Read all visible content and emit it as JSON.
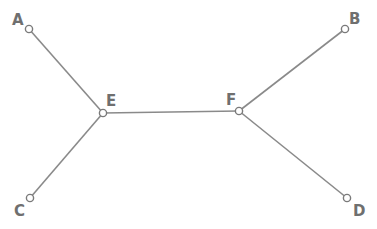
{
  "diagram": {
    "type": "tree",
    "colors": {
      "edge": "#8a8a8a",
      "node_stroke": "#7a7a7a",
      "node_fill": "#ffffff",
      "label": "#6f6f6f"
    },
    "nodes": [
      {
        "id": "A",
        "label": "A",
        "x": 29,
        "y": 29,
        "lx": 12,
        "ly": 25
      },
      {
        "id": "B",
        "label": "B",
        "x": 345,
        "y": 29,
        "lx": 349,
        "ly": 24
      },
      {
        "id": "C",
        "label": "C",
        "x": 30,
        "y": 198,
        "lx": 14,
        "ly": 216
      },
      {
        "id": "D",
        "label": "D",
        "x": 347,
        "y": 198,
        "lx": 353,
        "ly": 216
      },
      {
        "id": "E",
        "label": "E",
        "x": 103,
        "y": 113,
        "lx": 106,
        "ly": 106
      },
      {
        "id": "F",
        "label": "F",
        "x": 239,
        "y": 111,
        "lx": 226,
        "ly": 105
      }
    ],
    "edges": [
      {
        "from": "A",
        "to": "E"
      },
      {
        "from": "C",
        "to": "E"
      },
      {
        "from": "E",
        "to": "F"
      },
      {
        "from": "F",
        "to": "B"
      },
      {
        "from": "F",
        "to": "D"
      }
    ]
  }
}
